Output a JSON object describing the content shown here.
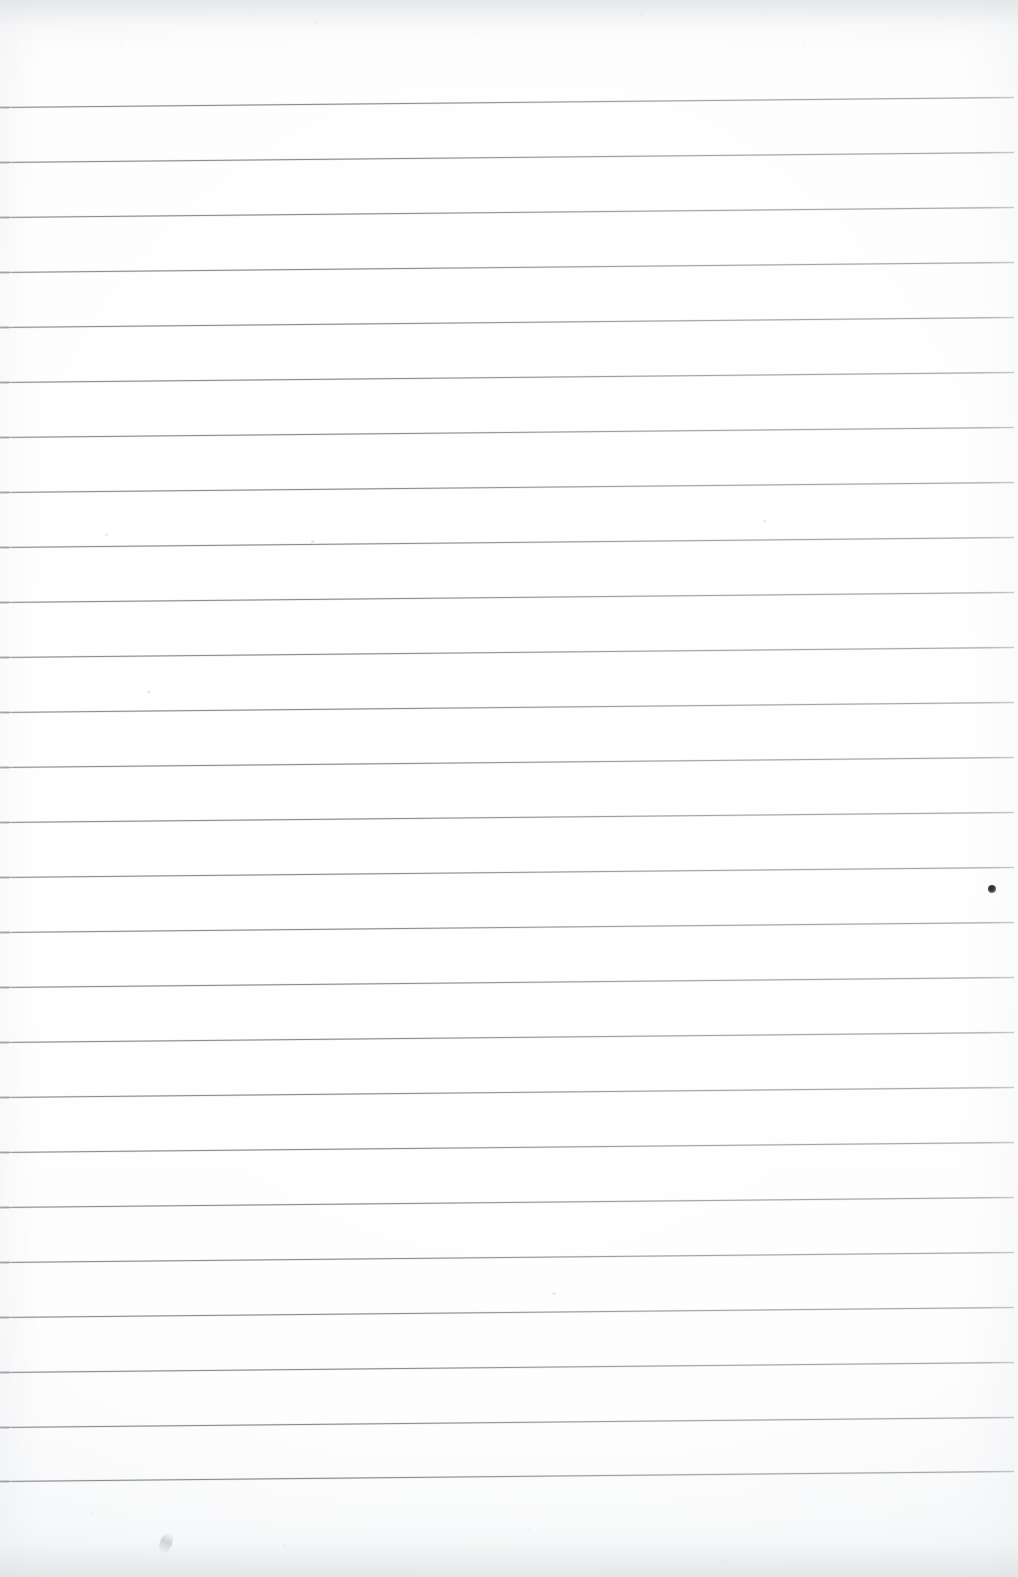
{
  "document": {
    "kind": "scanned-ruled-paper",
    "description": "Blank lined notebook page, scanned",
    "page_width": 1018,
    "page_height": 1577,
    "text_content": "",
    "has_handwriting": false,
    "has_printed_text": false
  },
  "colors": {
    "paper": "#fefefe",
    "paper_edge_tint": "#f2f3f4",
    "rule_line": "#9a9da1",
    "rule_line_dark": "#85888c",
    "ink_mark": "#2c2c2e",
    "pencil_mark": "#c4c7cb"
  },
  "ruling": {
    "style": "horizontal-rules",
    "line_count": 26,
    "spacing_px": 55,
    "thickness_px": 1,
    "first_line_y_left": 107,
    "last_line_y_left": 1481,
    "skew_px_across_page": -10,
    "left_margin_rule": false,
    "right_margin_rule": false,
    "line_left_x": 0,
    "line_right_x": 1014,
    "lines": [
      {
        "index": 1,
        "y_left": 107,
        "y_right": 97
      },
      {
        "index": 2,
        "y_left": 162,
        "y_right": 152
      },
      {
        "index": 3,
        "y_left": 217,
        "y_right": 207
      },
      {
        "index": 4,
        "y_left": 272,
        "y_right": 262
      },
      {
        "index": 5,
        "y_left": 327,
        "y_right": 317
      },
      {
        "index": 6,
        "y_left": 382,
        "y_right": 372
      },
      {
        "index": 7,
        "y_left": 437,
        "y_right": 427
      },
      {
        "index": 8,
        "y_left": 492,
        "y_right": 482
      },
      {
        "index": 9,
        "y_left": 547,
        "y_right": 537
      },
      {
        "index": 10,
        "y_left": 602,
        "y_right": 592
      },
      {
        "index": 11,
        "y_left": 657,
        "y_right": 647
      },
      {
        "index": 12,
        "y_left": 712,
        "y_right": 702
      },
      {
        "index": 13,
        "y_left": 767,
        "y_right": 757
      },
      {
        "index": 14,
        "y_left": 822,
        "y_right": 812
      },
      {
        "index": 15,
        "y_left": 877,
        "y_right": 867
      },
      {
        "index": 16,
        "y_left": 932,
        "y_right": 922
      },
      {
        "index": 17,
        "y_left": 987,
        "y_right": 977
      },
      {
        "index": 18,
        "y_left": 1042,
        "y_right": 1032
      },
      {
        "index": 19,
        "y_left": 1097,
        "y_right": 1087
      },
      {
        "index": 20,
        "y_left": 1152,
        "y_right": 1142
      },
      {
        "index": 21,
        "y_left": 1207,
        "y_right": 1197
      },
      {
        "index": 22,
        "y_left": 1262,
        "y_right": 1252
      },
      {
        "index": 23,
        "y_left": 1317,
        "y_right": 1307
      },
      {
        "index": 24,
        "y_left": 1372,
        "y_right": 1362
      },
      {
        "index": 25,
        "y_left": 1427,
        "y_right": 1417
      },
      {
        "index": 26,
        "y_left": 1481,
        "y_right": 1471
      }
    ]
  },
  "marks": [
    {
      "id": "ink-dot-right-margin",
      "type": "ink-dot",
      "x": 988,
      "y": 885,
      "width": 8,
      "height": 8,
      "between_lines": [
        14,
        15
      ]
    },
    {
      "id": "pencil-stroke-bottom-left",
      "type": "pencil-stroke",
      "x": 160,
      "y": 1532,
      "width": 12,
      "height": 22,
      "rotation_deg": 22
    },
    {
      "id": "speck-upper-left",
      "type": "speck",
      "x": 104,
      "y": 533,
      "width": 5,
      "height": 4
    },
    {
      "id": "speck-mid-page",
      "type": "speck",
      "x": 309,
      "y": 540,
      "width": 7,
      "height": 3
    },
    {
      "id": "speck-upper-right",
      "type": "speck",
      "x": 762,
      "y": 519,
      "width": 5,
      "height": 4
    },
    {
      "id": "speck-left-mid",
      "type": "speck",
      "x": 146,
      "y": 690,
      "width": 6,
      "height": 4
    },
    {
      "id": "speck-lower-mid",
      "type": "speck",
      "x": 551,
      "y": 1292,
      "width": 6,
      "height": 3
    }
  ]
}
